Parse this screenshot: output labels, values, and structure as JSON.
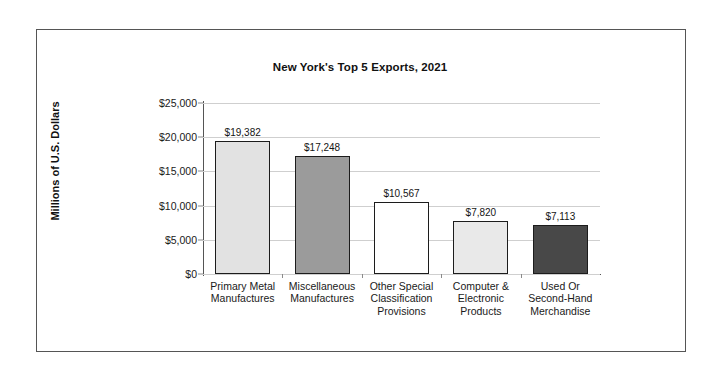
{
  "chart_data": {
    "type": "bar",
    "title": "New York's Top 5 Exports, 2021",
    "xlabel": "",
    "ylabel": "Millions of U.S. Dollars",
    "ylim": [
      0,
      25000
    ],
    "ytick_labels": [
      "$25,000",
      "$20,000",
      "$15,000",
      "$10,000",
      "$5,000",
      "$0"
    ],
    "ytick_values": [
      25000,
      20000,
      15000,
      10000,
      5000,
      0
    ],
    "grid": "horizontal",
    "legend": "none",
    "categories": [
      "Primary Metal Manufactures",
      "Miscellaneous Manufactures",
      "Other Special Classification Provisions",
      "Computer & Electronic Products",
      "Used Or Second-Hand Merchandise"
    ],
    "category_label_lines": [
      [
        "Primary Metal",
        "Manufactures"
      ],
      [
        "Miscellaneous",
        "Manufactures"
      ],
      [
        "Other Special",
        "Classification",
        "Provisions"
      ],
      [
        "Computer &",
        "Electronic",
        "Products"
      ],
      [
        "Used Or",
        "Second-Hand",
        "Merchandise"
      ]
    ],
    "values": [
      19382,
      17248,
      10567,
      7820,
      7113
    ],
    "value_labels": [
      "$19,382",
      "$17,248",
      "$10,567",
      "$7,820",
      "$7,113"
    ],
    "bar_colors": [
      "#e2e2e2",
      "#9b9b9b",
      "#ffffff",
      "#e9e9e9",
      "#484848"
    ],
    "bar_border_color": "#1c1c1c",
    "gridline_color": "#cfcfcf",
    "axis_color": "#555555",
    "frame_color": "#555555",
    "background_color": "#ffffff"
  }
}
